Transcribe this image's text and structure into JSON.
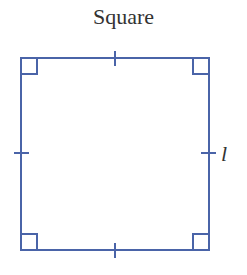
{
  "title": "Square",
  "side_label": "l",
  "colors": {
    "stroke": "#4a64a8",
    "text": "#333333"
  },
  "shape": {
    "type": "square",
    "x1": 21,
    "y1": 58,
    "x2": 209,
    "y2": 250,
    "right_angle_markers": 4,
    "congruent_tick_marks": 4
  }
}
